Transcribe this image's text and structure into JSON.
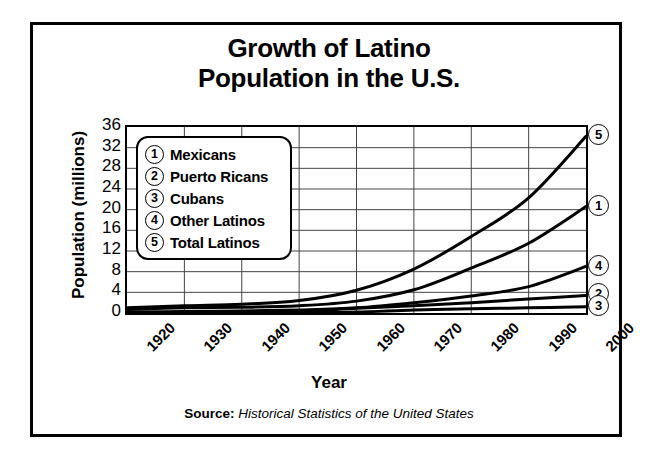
{
  "title_lines": [
    "Growth of Latino",
    "Population in the U.S."
  ],
  "axis": {
    "y_label": "Population (millions)",
    "x_label": "Year"
  },
  "source": {
    "prefix": "Source:",
    "text": "Historical Statistics of the United States"
  },
  "legend": [
    {
      "num": "1",
      "label": "Mexicans"
    },
    {
      "num": "2",
      "label": "Puerto Ricans"
    },
    {
      "num": "3",
      "label": "Cubans"
    },
    {
      "num": "4",
      "label": "Other Latinos"
    },
    {
      "num": "5",
      "label": "Total Latinos"
    }
  ],
  "end_markers": [
    {
      "num": "5"
    },
    {
      "num": "1"
    },
    {
      "num": "4"
    },
    {
      "num": "2"
    },
    {
      "num": "3"
    }
  ],
  "colors": {
    "line": "#000000",
    "grid": "#444444",
    "frame": "#000000",
    "background": "#ffffff"
  },
  "chart_data": {
    "type": "line",
    "title": "Growth of Latino Population in the U.S.",
    "xlabel": "Year",
    "ylabel": "Population (millions)",
    "xlim": [
      1920,
      2000
    ],
    "ylim": [
      0,
      36
    ],
    "yticks": [
      0,
      4,
      8,
      12,
      16,
      20,
      24,
      28,
      32,
      36
    ],
    "xticks": [
      1920,
      1930,
      1940,
      1950,
      1960,
      1970,
      1980,
      1990,
      2000
    ],
    "grid": true,
    "legend_position": "upper-left-inside",
    "x": [
      1920,
      1930,
      1940,
      1950,
      1960,
      1970,
      1980,
      1990,
      2000
    ],
    "series": [
      {
        "name": "Mexicans",
        "key": "1",
        "values": [
          0.7,
          1.0,
          1.1,
          1.4,
          2.3,
          4.5,
          8.7,
          13.5,
          20.6
        ]
      },
      {
        "name": "Puerto Ricans",
        "key": "2",
        "values": [
          0.1,
          0.1,
          0.1,
          0.3,
          0.9,
          1.4,
          2.0,
          2.7,
          3.4
        ]
      },
      {
        "name": "Cubans",
        "key": "3",
        "values": [
          0.0,
          0.0,
          0.1,
          0.1,
          0.2,
          0.6,
          0.8,
          1.0,
          1.2
        ]
      },
      {
        "name": "Other Latinos",
        "key": "4",
        "values": [
          0.2,
          0.3,
          0.4,
          0.6,
          1.0,
          2.0,
          3.3,
          5.1,
          9.0
        ]
      },
      {
        "name": "Total Latinos",
        "key": "5",
        "values": [
          1.0,
          1.4,
          1.7,
          2.4,
          4.4,
          8.5,
          14.8,
          22.3,
          34.2
        ]
      }
    ]
  }
}
